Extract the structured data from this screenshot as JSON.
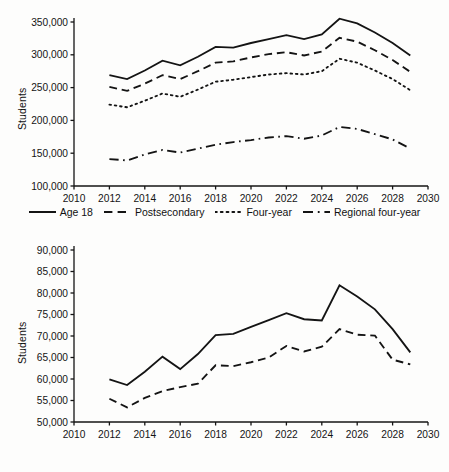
{
  "figure": {
    "background_color": "#fdfdfc",
    "line_color": "#141414",
    "axis_color": "#141414"
  },
  "chart_data": [
    {
      "type": "line",
      "panel": "top",
      "title": "",
      "xlabel": "",
      "ylabel": "Students",
      "xlim": [
        2010,
        2030
      ],
      "ylim": [
        100000,
        350000
      ],
      "xticks": [
        2010,
        2012,
        2014,
        2016,
        2018,
        2020,
        2022,
        2024,
        2026,
        2028,
        2030
      ],
      "xticklabels": [
        "2010",
        "2012",
        "2014",
        "2016",
        "2018",
        "2020",
        "2022",
        "2024",
        "2026",
        "2028",
        "2030"
      ],
      "yticks": [
        100000,
        150000,
        200000,
        250000,
        300000,
        350000
      ],
      "yticklabels": [
        "100,000",
        "150,000",
        "200,000",
        "250,000",
        "300,000",
        "350,000"
      ],
      "grid": false,
      "legend_position": "below",
      "x": [
        2012,
        2013,
        2014,
        2015,
        2016,
        2017,
        2018,
        2019,
        2020,
        2021,
        2022,
        2023,
        2024,
        2025,
        2026,
        2027,
        2028,
        2029
      ],
      "series": [
        {
          "name": "Age 18",
          "style": "solid",
          "values": [
            269000,
            263000,
            276000,
            291000,
            284000,
            297000,
            312000,
            311000,
            318000,
            324000,
            330000,
            324000,
            331000,
            355000,
            348000,
            334000,
            318000,
            299000
          ]
        },
        {
          "name": "Postsecondary",
          "style": "dashed",
          "values": [
            251000,
            245000,
            256000,
            269000,
            263000,
            275000,
            288000,
            290000,
            296000,
            301000,
            304000,
            299000,
            305000,
            326000,
            320000,
            307000,
            292000,
            274000
          ]
        },
        {
          "name": "Four-year",
          "style": "dotted",
          "values": [
            224000,
            220000,
            230000,
            241000,
            236000,
            247000,
            259000,
            262000,
            266000,
            270000,
            272000,
            270000,
            275000,
            294000,
            288000,
            276000,
            263000,
            246000
          ]
        },
        {
          "name": "Regional four-year",
          "style": "dashdot",
          "values": [
            141000,
            139000,
            148000,
            155000,
            151000,
            157000,
            163000,
            167000,
            170000,
            174000,
            176000,
            172000,
            177000,
            190000,
            187000,
            179000,
            171000,
            157000
          ]
        }
      ]
    },
    {
      "type": "line",
      "panel": "bottom",
      "title": "",
      "xlabel": "",
      "ylabel": "Students",
      "xlim": [
        2010,
        2030
      ],
      "ylim": [
        50000,
        90000
      ],
      "xticks": [
        2010,
        2012,
        2014,
        2016,
        2018,
        2020,
        2022,
        2024,
        2026,
        2028,
        2030
      ],
      "xticklabels": [
        "2010",
        "2012",
        "2014",
        "2016",
        "2018",
        "2020",
        "2022",
        "2024",
        "2026",
        "2028",
        "2030"
      ],
      "yticks": [
        50000,
        55000,
        60000,
        65000,
        70000,
        75000,
        80000,
        85000,
        90000
      ],
      "yticklabels": [
        "50,000",
        "55,000",
        "60,000",
        "65,000",
        "70,000",
        "75,000",
        "80,000",
        "85,000",
        "90,000"
      ],
      "grid": false,
      "legend_position": "below",
      "x": [
        2012,
        2013,
        2014,
        2015,
        2016,
        2017,
        2018,
        2019,
        2020,
        2021,
        2022,
        2023,
        2024,
        2025,
        2026,
        2027,
        2028,
        2029
      ],
      "series": [
        {
          "name": "National",
          "style": "solid",
          "values": [
            59900,
            58600,
            61700,
            65200,
            62300,
            65800,
            70200,
            70500,
            72100,
            73700,
            75300,
            73900,
            73600,
            81800,
            79200,
            76200,
            71600,
            66200
          ]
        },
        {
          "name": "Elite",
          "style": "dashed",
          "values": [
            55400,
            53400,
            55600,
            57200,
            58100,
            58900,
            63200,
            63000,
            63900,
            65000,
            67700,
            66400,
            67500,
            71600,
            70300,
            70100,
            64500,
            63400
          ]
        }
      ]
    }
  ]
}
